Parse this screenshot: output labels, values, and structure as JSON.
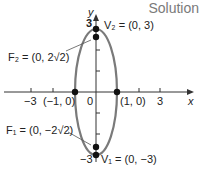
{
  "header": {
    "title": "Solution"
  },
  "axes": {
    "x_label": "x",
    "y_label": "y"
  },
  "x_ticks": [
    {
      "label": "−3",
      "x": 31
    },
    {
      "label": "(−1, 0)",
      "x": 55
    },
    {
      "label": "0",
      "x": 89
    },
    {
      "label": "(1, 0)",
      "x": 136
    },
    {
      "label": "3",
      "x": 160
    }
  ],
  "y_ticks": [
    {
      "label": "3",
      "y": 25
    },
    {
      "label": "−3",
      "y": 161
    }
  ],
  "points": {
    "V2": {
      "label": "V₂ = (0, 3)"
    },
    "F2": {
      "label": "F₂ = (0, 2√2)"
    },
    "F1": {
      "label": "F₁ = (0, −2√2)"
    },
    "V1": {
      "label": "V₁ = (0, −3)"
    }
  },
  "colors": {
    "ellipse": "#7a7a7a",
    "axis": "#333333",
    "point": "#111111"
  }
}
